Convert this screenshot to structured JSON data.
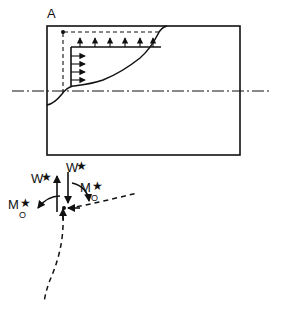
{
  "figure": {
    "title_label": "A",
    "background_color": "#ffffff",
    "ink_color": "#111111",
    "width": 282,
    "height": 316
  },
  "upper_diagram": {
    "name": "duct-cross-section-with-velocity-profile",
    "section_label": "A",
    "outer_rectangle": {
      "x": 47,
      "y": 26,
      "width": 193,
      "height": 129
    },
    "centerline": {
      "y": 91,
      "x_start": 12,
      "x_end": 272,
      "style": "dash-dot"
    },
    "control_volume": {
      "vertical_dashed_x": 63,
      "vertical_dashed_y_top": 32,
      "vertical_dashed_y_bottom": 93,
      "horizontal_dashed_y": 32,
      "horizontal_dashed_x_start": 63,
      "horizontal_dashed_x_end": 161,
      "corner_dot": {
        "x": 63,
        "y": 32
      }
    },
    "top_flux_arrows": {
      "label": "upward-flux-arrows",
      "count": 6,
      "baseline_y": 47,
      "tip_y": 36,
      "x_positions": [
        80,
        95,
        110,
        125,
        140,
        152
      ],
      "direction": "up"
    },
    "side_flux_arrows": {
      "label": "rightward-flux-arrows",
      "count": 4,
      "baseline_x": 71,
      "tip_x": 86,
      "y_positions": [
        56,
        64,
        72,
        80
      ],
      "direction": "right"
    },
    "inner_solid_frame": {
      "top_y": 47,
      "left_x": 71,
      "right_x": 161,
      "bottom_y": 86
    },
    "velocity_profile_curve": "boundary-layer-profile"
  },
  "lower_diagram": {
    "name": "force-moment-free-body-diagram",
    "node": {
      "x": 63,
      "y": 208
    },
    "labels": {
      "force_up": {
        "text": "W",
        "star": "★",
        "x": 38,
        "y": 180
      },
      "force_down": {
        "text": "W",
        "star": "★",
        "x": 73,
        "y": 170
      },
      "moment_right": {
        "text": "M",
        "star": "★",
        "sub": "O",
        "x": 82,
        "y": 190
      },
      "moment_left": {
        "text": "M",
        "star": "★",
        "sub": "O",
        "x": 12,
        "y": 207
      }
    },
    "arrows": {
      "up_force_arrow": {
        "x": 57,
        "y_tail": 212,
        "y_tip": 175,
        "direction": "up"
      },
      "down_force_arrow": {
        "x": 68,
        "y_tail": 172,
        "y_tip": 205,
        "direction": "down"
      },
      "node_up_arrow": {
        "x": 63,
        "y_tail": 222,
        "y_tip": 207,
        "direction": "up"
      },
      "node_left_arrow": {
        "x_tail": 82,
        "x_tip": 66,
        "y": 208,
        "direction": "left"
      },
      "moment_arc_left": "counterclockwise-curved-arrow",
      "moment_arc_right": "clockwise-curved-arrow"
    },
    "dashed_members": {
      "right_member": {
        "x_start": 66,
        "y_start": 208,
        "x_end": 138,
        "y_end": 193
      },
      "lower_member": "curved-dashed-column"
    }
  }
}
